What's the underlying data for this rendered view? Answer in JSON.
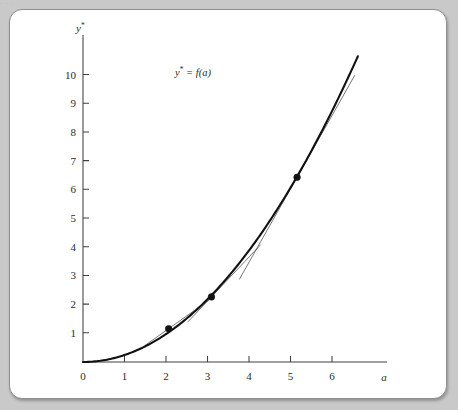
{
  "figure": {
    "background_color": "#c9c9c9",
    "card_color": "#ffffff",
    "border_color": "#8e8e8e",
    "curve_color": "#111111",
    "tangent_color": "#555555",
    "axis_color": "#404040"
  },
  "top_bleed_text": "· · ·",
  "chart_data": {
    "type": "line",
    "title": "",
    "subtitle": "",
    "xlabel": "a",
    "ylabel": "y*",
    "curve_label": "y* = f(a)",
    "curve_label_base": "y",
    "curve_label_star": "*",
    "curve_label_rest": " = f(a)",
    "ylabel_base": "y",
    "ylabel_star": "*",
    "grid": false,
    "legend": "none",
    "xlim": [
      0,
      7.1
    ],
    "ylim": [
      0,
      10.8
    ],
    "xticks": [
      0,
      1,
      2,
      3,
      4,
      5,
      6
    ],
    "xtick_labels": [
      "0",
      "1",
      "2",
      "3",
      "4",
      "5",
      "6"
    ],
    "yticks": [
      1,
      2,
      3,
      4,
      5,
      6,
      7,
      8,
      9,
      10
    ],
    "ytick_labels": [
      "1",
      "2",
      "3",
      "4",
      "5",
      "6",
      "7",
      "8",
      "9",
      "10"
    ],
    "series": [
      {
        "name": "y* = f(a)",
        "kind": "curve",
        "note": "convex increasing function, approximately y = 0.245 a^2",
        "x": [
          0.0,
          0.5,
          1.0,
          1.5,
          2.0,
          2.5,
          3.0,
          3.5,
          4.0,
          4.5,
          5.0,
          5.5,
          6.0,
          6.3
        ],
        "y": [
          0.0,
          0.06,
          0.25,
          0.55,
          1.0,
          1.55,
          2.2,
          3.0,
          3.95,
          5.0,
          6.1,
          7.4,
          8.8,
          9.8
        ]
      }
    ],
    "points": [
      {
        "label": "point-a2",
        "x": 2.0,
        "y": 1.1
      },
      {
        "label": "point-a3",
        "x": 3.0,
        "y": 2.15
      },
      {
        "label": "point-a5",
        "x": 5.0,
        "y": 6.1
      }
    ],
    "tangents": [
      {
        "label": "tangent-at-a2",
        "at_x": 2.0,
        "at_y": 1.1,
        "slope": 1.0,
        "x_from": 1.45,
        "x_to": 2.95
      },
      {
        "label": "tangent-at-a3",
        "at_x": 3.0,
        "at_y": 2.15,
        "slope": 1.5,
        "x_from": 2.45,
        "x_to": 4.15
      },
      {
        "label": "tangent-at-a5",
        "at_x": 5.0,
        "at_y": 6.1,
        "slope": 2.5,
        "x_from": 3.65,
        "x_to": 6.35
      }
    ],
    "annotations": [
      {
        "name": "curve-label",
        "text": "y* = f(a)",
        "x": 3.55,
        "y": 9.45
      }
    ]
  }
}
